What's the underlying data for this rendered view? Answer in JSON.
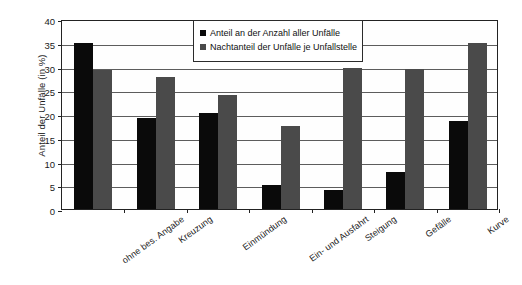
{
  "chart_data": {
    "type": "bar",
    "title": "",
    "xlabel": "",
    "ylabel": "Anteil der Unfälle (in %)",
    "ylim": [
      0,
      40
    ],
    "yticks": [
      0,
      5,
      10,
      15,
      20,
      25,
      30,
      35,
      40
    ],
    "ytick_labels": [
      "0",
      "5",
      "10",
      "15",
      "20",
      "25",
      "30",
      "35",
      "40"
    ],
    "grid": true,
    "legend_position": "top-center",
    "categories": [
      "ohne bes. Angabe",
      "Kreuzung",
      "Einmündung",
      "Ein- und Ausfahrt",
      "Steigung",
      "Gefälle",
      "Kurve"
    ],
    "series": [
      {
        "name": "Anteil an der Anzahl aller Unfälle",
        "color": "#0a0a0a",
        "values": [
          35.0,
          19.2,
          20.2,
          5.1,
          4.1,
          7.7,
          18.5
        ]
      },
      {
        "name": "Nachtanteil der Unfälle je Unfallstelle",
        "color": "#4a4a4a",
        "values": [
          29.2,
          27.7,
          24.1,
          17.4,
          29.7,
          29.5,
          35.0
        ]
      }
    ]
  }
}
